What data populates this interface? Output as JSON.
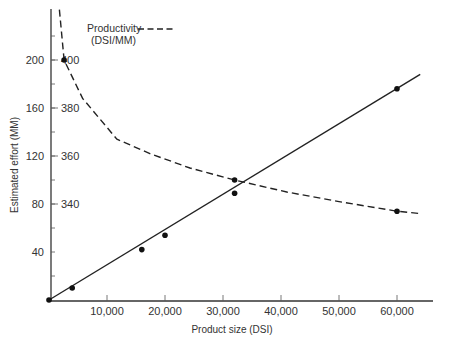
{
  "chart_data": {
    "type": "line",
    "title": "",
    "xlabel": "Product size (DSI)",
    "ylabel": "Estimated effort (MM)",
    "xlim": [
      0,
      66000
    ],
    "ylim": [
      0,
      240
    ],
    "grid": false,
    "x_ticks": [
      10000,
      20000,
      30000,
      40000,
      50000,
      60000
    ],
    "x_tick_labels": [
      "10,000",
      "20,000",
      "30,000",
      "40,000",
      "50,000",
      "60,000"
    ],
    "y_ticks": [
      40,
      80,
      120,
      160,
      200
    ],
    "y_tick_labels": [
      "40",
      "80",
      "120",
      "160",
      "200"
    ],
    "secondary_y_ticks": [
      340,
      360,
      380,
      400
    ],
    "secondary_y_tick_labels": [
      "340",
      "360",
      "380",
      "400"
    ],
    "secondary_ylabel": "Productivity (DSI/MM)",
    "legend": {
      "position": "top-left",
      "entries": [
        {
          "label": "Productivity",
          "sublabel": "(DSI/MM)",
          "style": "dashed"
        }
      ]
    },
    "series": [
      {
        "name": "Estimated effort (MM)",
        "style": "solid",
        "axis": "primary",
        "markers": [
          {
            "x": 0,
            "y": 0
          },
          {
            "x": 4000,
            "y": 10
          },
          {
            "x": 16000,
            "y": 42
          },
          {
            "x": 20000,
            "y": 54
          },
          {
            "x": 32000,
            "y": 89
          },
          {
            "x": 60000,
            "y": 176
          }
        ],
        "line": [
          {
            "x": 0,
            "y": 0
          },
          {
            "x": 64000,
            "y": 188
          }
        ]
      },
      {
        "name": "Productivity (DSI/MM)",
        "style": "dashed",
        "axis": "secondary",
        "markers": [
          {
            "x": 2600,
            "y": 400
          },
          {
            "x": 32000,
            "y": 350
          },
          {
            "x": 60000,
            "y": 337
          }
        ],
        "line": [
          {
            "x": 1800,
            "y": 421
          },
          {
            "x": 2600,
            "y": 400
          },
          {
            "x": 5800,
            "y": 384
          },
          {
            "x": 11700,
            "y": 367
          },
          {
            "x": 17400,
            "y": 361
          },
          {
            "x": 24300,
            "y": 355
          },
          {
            "x": 32000,
            "y": 350
          },
          {
            "x": 41000,
            "y": 345
          },
          {
            "x": 50000,
            "y": 341
          },
          {
            "x": 60000,
            "y": 337
          },
          {
            "x": 64000,
            "y": 336
          }
        ]
      }
    ]
  }
}
